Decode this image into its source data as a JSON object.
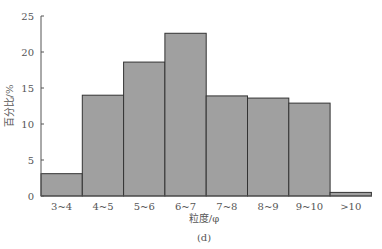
{
  "chart_data": {
    "type": "bar",
    "title": "",
    "caption": "(d)",
    "xlabel": "粒度/φ",
    "ylabel": "百分比/%",
    "ylim": [
      0,
      25
    ],
    "yticks": [
      0,
      5,
      10,
      15,
      20,
      25
    ],
    "categories": [
      "3~4",
      "4~5",
      "5~6",
      "6~7",
      "7~8",
      "8~9",
      "9~10",
      ">10"
    ],
    "values": [
      3.1,
      14.0,
      18.6,
      22.6,
      13.9,
      13.6,
      12.9,
      0.5
    ],
    "bar_color": "#a0a0a0",
    "edge_color": "#333333",
    "grid": false
  }
}
